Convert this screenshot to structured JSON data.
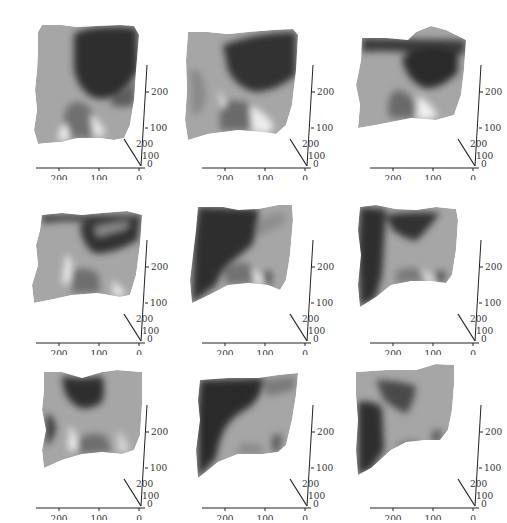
{
  "figure": {
    "layout": {
      "rows": 3,
      "cols": 3
    },
    "background": "#ffffff",
    "colormap": "gray"
  },
  "chart_data": [
    {
      "type": "surface3d",
      "panel": 1,
      "title": "",
      "x_ticks": [
        "200",
        "100",
        "0"
      ],
      "y_ticks": [
        "200",
        "100",
        "0"
      ],
      "z_ticks": [
        "100",
        "200"
      ],
      "xlim": [
        0,
        250
      ],
      "ylim": [
        0,
        250
      ],
      "zlim": [
        0,
        280
      ],
      "dark_region": "upper-right"
    },
    {
      "type": "surface3d",
      "panel": 2,
      "title": "",
      "x_ticks": [
        "200",
        "100",
        "0"
      ],
      "y_ticks": [
        "200",
        "100",
        "0"
      ],
      "z_ticks": [
        "100",
        "200"
      ],
      "xlim": [
        0,
        250
      ],
      "ylim": [
        0,
        250
      ],
      "zlim": [
        0,
        280
      ],
      "dark_region": "upper-center-right"
    },
    {
      "type": "surface3d",
      "panel": 3,
      "title": "",
      "x_ticks": [
        "200",
        "100",
        "0"
      ],
      "y_ticks": [
        "200",
        "100",
        "0"
      ],
      "z_ticks": [
        "100",
        "200"
      ],
      "xlim": [
        0,
        250
      ],
      "ylim": [
        0,
        250
      ],
      "zlim": [
        0,
        280
      ],
      "dark_region": "upper-center"
    },
    {
      "type": "surface3d",
      "panel": 4,
      "title": "",
      "x_ticks": [
        "200",
        "100",
        "0"
      ],
      "y_ticks": [
        "200",
        "100",
        "0"
      ],
      "z_ticks": [
        "100",
        "200"
      ],
      "xlim": [
        0,
        250
      ],
      "ylim": [
        0,
        250
      ],
      "zlim": [
        0,
        280
      ],
      "dark_region": "upper-center"
    },
    {
      "type": "surface3d",
      "panel": 5,
      "title": "",
      "x_ticks": [
        "200",
        "100",
        "0"
      ],
      "y_ticks": [
        "200",
        "100",
        "0"
      ],
      "z_ticks": [
        "100",
        "200"
      ],
      "xlim": [
        0,
        250
      ],
      "ylim": [
        0,
        250
      ],
      "zlim": [
        0,
        280
      ],
      "dark_region": "upper-left"
    },
    {
      "type": "surface3d",
      "panel": 6,
      "title": "",
      "x_ticks": [
        "200",
        "100",
        "0"
      ],
      "y_ticks": [
        "200",
        "100",
        "0"
      ],
      "z_ticks": [
        "100",
        "200"
      ],
      "xlim": [
        0,
        250
      ],
      "ylim": [
        0,
        250
      ],
      "zlim": [
        0,
        280
      ],
      "dark_region": "left-and-top"
    },
    {
      "type": "surface3d",
      "panel": 7,
      "title": "",
      "x_ticks": [
        "200",
        "100",
        "0"
      ],
      "y_ticks": [
        "200",
        "100",
        "0"
      ],
      "z_ticks": [
        "100",
        "200"
      ],
      "xlim": [
        0,
        250
      ],
      "ylim": [
        0,
        250
      ],
      "zlim": [
        0,
        280
      ],
      "dark_region": "upper-center"
    },
    {
      "type": "surface3d",
      "panel": 8,
      "title": "",
      "x_ticks": [
        "200",
        "100",
        "0"
      ],
      "y_ticks": [
        "200",
        "100",
        "0"
      ],
      "z_ticks": [
        "100",
        "200"
      ],
      "xlim": [
        0,
        250
      ],
      "ylim": [
        0,
        250
      ],
      "zlim": [
        0,
        280
      ],
      "dark_region": "left-diagonal"
    },
    {
      "type": "surface3d",
      "panel": 9,
      "title": "",
      "x_ticks": [
        "200",
        "100",
        "0"
      ],
      "y_ticks": [
        "200",
        "100",
        "0"
      ],
      "z_ticks": [
        "100",
        "200"
      ],
      "xlim": [
        0,
        250
      ],
      "ylim": [
        0,
        250
      ],
      "zlim": [
        0,
        280
      ],
      "dark_region": "left"
    }
  ],
  "labels": {
    "x200": "200",
    "x100": "100",
    "x0": "0",
    "z200": "200",
    "z100": "100",
    "y200": "200",
    "y100": "100",
    "y0": "0"
  }
}
